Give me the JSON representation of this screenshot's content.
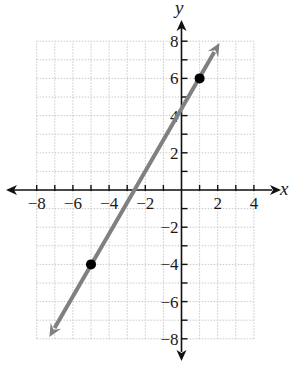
{
  "chart_data": {
    "type": "line",
    "title": "",
    "xlabel": "x",
    "ylabel": "y",
    "xlim": [
      -8,
      4
    ],
    "ylim": [
      -8,
      8
    ],
    "grid": true,
    "legend": null,
    "x_ticks": [
      -8,
      -7,
      -6,
      -5,
      -4,
      -3,
      -2,
      -1,
      0,
      1,
      2,
      3,
      4
    ],
    "y_ticks": [
      -8,
      -7,
      -6,
      -5,
      -4,
      -3,
      -2,
      -1,
      0,
      1,
      2,
      3,
      4,
      5,
      6,
      7,
      8
    ],
    "x_tick_labels": [
      "−8",
      "−6",
      "−4",
      "−2",
      "2",
      "4"
    ],
    "x_tick_label_values": [
      -8,
      -6,
      -4,
      -2,
      2,
      4
    ],
    "y_tick_labels": [
      "8",
      "6",
      "4",
      "2",
      "−2",
      "−4",
      "−6",
      "−8"
    ],
    "y_tick_label_values": [
      8,
      6,
      4,
      2,
      -2,
      -4,
      -6,
      -8
    ],
    "series": [
      {
        "name": "line",
        "kind": "line-with-arrows",
        "color": "#808080",
        "slope": 1.6667,
        "intercept": 4.3333,
        "x": [
          -7.3,
          2.1
        ],
        "y": [
          -7.9,
          7.9
        ]
      }
    ],
    "points": [
      {
        "x": 1,
        "y": 6,
        "color": "#000000"
      },
      {
        "x": -5,
        "y": -4,
        "color": "#000000"
      }
    ]
  },
  "colors": {
    "grid": "#c8c8c8",
    "axis": "#111111",
    "line": "#858585",
    "point": "#000000"
  }
}
